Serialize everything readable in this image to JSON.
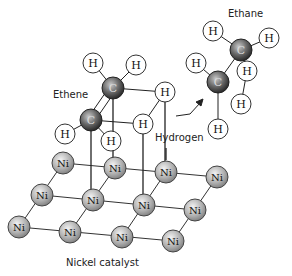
{
  "labels": {
    "ethene": "Ethene",
    "ethane": "Ethane",
    "hydrogen": "Hydrogen",
    "catalyst": "Nickel catalyst"
  },
  "atom_symbols": {
    "H": "H",
    "C": "C",
    "Ni": "Ni"
  },
  "colors": {
    "bond": "#222222",
    "h_fill": "#ffffff",
    "c_fill": "#555555",
    "ni_fill": "#b4b4b4",
    "stroke": "#333333"
  }
}
